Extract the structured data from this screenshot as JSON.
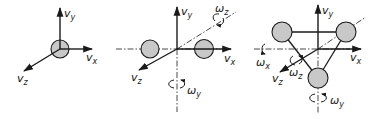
{
  "diagram": {
    "colors": {
      "mass_fill": "#c8c8c8",
      "stroke": "#1a1a1a",
      "background": "#ffffff"
    },
    "panels": [
      {
        "name": "monatomic",
        "labels": {
          "vy": "v",
          "vy_sub": "y",
          "vx": "v",
          "vx_sub": "x",
          "vz": "v",
          "vz_sub": "z"
        }
      },
      {
        "name": "linear",
        "labels": {
          "vy": "v",
          "vy_sub": "y",
          "vx": "v",
          "vx_sub": "x",
          "vz": "v",
          "vz_sub": "z",
          "wz": "ω",
          "wz_sub": "z",
          "wy": "ω",
          "wy_sub": "y"
        }
      },
      {
        "name": "nonlinear",
        "labels": {
          "vy": "v",
          "vy_sub": "y",
          "vx": "v",
          "vx_sub": "x",
          "vz": "v",
          "vz_sub": "z",
          "wx": "ω",
          "wx_sub": "x",
          "wz": "ω",
          "wz_sub": "z",
          "wy": "ω",
          "wy_sub": "y"
        }
      }
    ]
  }
}
